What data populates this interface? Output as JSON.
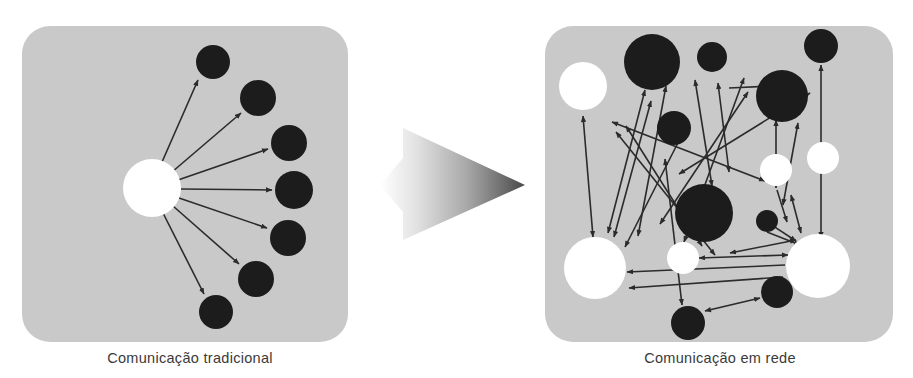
{
  "figure": {
    "type": "concept-diagram",
    "background_color": "#ffffff",
    "panel_fill": "#c9c9c9",
    "panel_corner_radius": 28,
    "node_dark_color": "#1c1c1c",
    "node_light_color": "#ffffff",
    "arrow_color": "#2b2b2b",
    "caption_color": "#3a3a3a",
    "transition_arrow": {
      "name": "gradient-transition-arrow",
      "shape": "triangle-right",
      "x1": 403,
      "y1": 128,
      "x2": 525,
      "y2": 185,
      "x3": 403,
      "y3": 240,
      "notch_x": 403,
      "notch_y": 158,
      "notch_x2": 380,
      "notch_y2": 185,
      "notch_y3": 212,
      "gradient_from": "#ffffff",
      "gradient_to": "#4a4a4a"
    },
    "panels": [
      {
        "id": "traditional",
        "name": "traditional-communication-panel",
        "caption": "Comunicação tradicional",
        "x": 22,
        "y": 26,
        "width": 326,
        "height": 316,
        "nodes": [
          {
            "id": "hub",
            "cx": 152,
            "cy": 188,
            "r": 29,
            "fill": "light",
            "label": "hub-node"
          },
          {
            "id": "r1",
            "cx": 213,
            "cy": 62,
            "r": 17,
            "fill": "dark",
            "label": "receiver-node-1"
          },
          {
            "id": "r2",
            "cx": 258,
            "cy": 98,
            "r": 18,
            "fill": "dark",
            "label": "receiver-node-2"
          },
          {
            "id": "r3",
            "cx": 289,
            "cy": 143,
            "r": 18,
            "fill": "dark",
            "label": "receiver-node-3"
          },
          {
            "id": "r4",
            "cx": 294,
            "cy": 190,
            "r": 19,
            "fill": "dark",
            "label": "receiver-node-4"
          },
          {
            "id": "r5",
            "cx": 288,
            "cy": 238,
            "r": 18,
            "fill": "dark",
            "label": "receiver-node-5"
          },
          {
            "id": "r6",
            "cx": 256,
            "cy": 279,
            "r": 18,
            "fill": "dark",
            "label": "receiver-node-6"
          },
          {
            "id": "r7",
            "cx": 216,
            "cy": 312,
            "r": 17,
            "fill": "dark",
            "label": "receiver-node-7"
          }
        ],
        "edges": [
          {
            "x1": 162,
            "y1": 162,
            "x2": 198,
            "y2": 80,
            "heads": "end"
          },
          {
            "x1": 172,
            "y1": 172,
            "x2": 241,
            "y2": 113,
            "heads": "end"
          },
          {
            "x1": 178,
            "y1": 180,
            "x2": 268,
            "y2": 149,
            "heads": "end"
          },
          {
            "x1": 181,
            "y1": 189,
            "x2": 272,
            "y2": 190,
            "heads": "end"
          },
          {
            "x1": 179,
            "y1": 198,
            "x2": 267,
            "y2": 228,
            "heads": "end"
          },
          {
            "x1": 173,
            "y1": 206,
            "x2": 239,
            "y2": 264,
            "heads": "end"
          },
          {
            "x1": 163,
            "y1": 213,
            "x2": 204,
            "y2": 294,
            "heads": "end"
          }
        ]
      },
      {
        "id": "network",
        "name": "network-communication-panel",
        "caption": "Comunicação em rede",
        "x": 545,
        "y": 26,
        "width": 348,
        "height": 316,
        "nodes": [
          {
            "id": "n1",
            "cx": 583,
            "cy": 86,
            "r": 24,
            "fill": "light",
            "label": "network-node-1"
          },
          {
            "id": "n2",
            "cx": 652,
            "cy": 62,
            "r": 28,
            "fill": "dark",
            "label": "network-node-2"
          },
          {
            "id": "n3",
            "cx": 712,
            "cy": 57,
            "r": 15,
            "fill": "dark",
            "label": "network-node-3"
          },
          {
            "id": "n4",
            "cx": 821,
            "cy": 46,
            "r": 17,
            "fill": "dark",
            "label": "network-node-4"
          },
          {
            "id": "n5",
            "cx": 782,
            "cy": 96,
            "r": 26,
            "fill": "dark",
            "label": "network-node-5"
          },
          {
            "id": "n6",
            "cx": 674,
            "cy": 128,
            "r": 17,
            "fill": "dark",
            "label": "network-node-6"
          },
          {
            "id": "n7",
            "cx": 823,
            "cy": 158,
            "r": 16,
            "fill": "light",
            "label": "network-node-7"
          },
          {
            "id": "n8",
            "cx": 776,
            "cy": 170,
            "r": 16,
            "fill": "light",
            "label": "network-node-8"
          },
          {
            "id": "n9",
            "cx": 704,
            "cy": 213,
            "r": 29,
            "fill": "dark",
            "label": "network-node-9"
          },
          {
            "id": "n10",
            "cx": 767,
            "cy": 221,
            "r": 11,
            "fill": "dark",
            "label": "network-node-10"
          },
          {
            "id": "n11",
            "cx": 595,
            "cy": 268,
            "r": 31,
            "fill": "light",
            "label": "network-node-11"
          },
          {
            "id": "n12",
            "cx": 683,
            "cy": 258,
            "r": 16,
            "fill": "light",
            "label": "network-node-12"
          },
          {
            "id": "n13",
            "cx": 818,
            "cy": 266,
            "r": 32,
            "fill": "light",
            "label": "network-node-13"
          },
          {
            "id": "n14",
            "cx": 777,
            "cy": 292,
            "r": 16,
            "fill": "dark",
            "label": "network-node-14"
          },
          {
            "id": "n15",
            "cx": 688,
            "cy": 323,
            "r": 17,
            "fill": "dark",
            "label": "network-node-15"
          }
        ],
        "edges": [
          {
            "x1": 583,
            "y1": 116,
            "x2": 593,
            "y2": 237,
            "heads": "both"
          },
          {
            "x1": 608,
            "y1": 233,
            "x2": 645,
            "y2": 90,
            "heads": "both"
          },
          {
            "x1": 614,
            "y1": 237,
            "x2": 651,
            "y2": 101,
            "heads": "both"
          },
          {
            "x1": 625,
            "y1": 247,
            "x2": 688,
            "y2": 123,
            "heads": "both"
          },
          {
            "x1": 626,
            "y1": 126,
            "x2": 702,
            "y2": 246,
            "heads": "both"
          },
          {
            "x1": 616,
            "y1": 132,
            "x2": 715,
            "y2": 255,
            "heads": "both"
          },
          {
            "x1": 612,
            "y1": 122,
            "x2": 765,
            "y2": 181,
            "heads": "both"
          },
          {
            "x1": 679,
            "y1": 174,
            "x2": 810,
            "y2": 93,
            "heads": "both"
          },
          {
            "x1": 684,
            "y1": 242,
            "x2": 744,
            "y2": 78,
            "heads": "both"
          },
          {
            "x1": 695,
            "y1": 80,
            "x2": 712,
            "y2": 186,
            "heads": "both"
          },
          {
            "x1": 718,
            "y1": 83,
            "x2": 729,
            "y2": 172,
            "heads": "both"
          },
          {
            "x1": 660,
            "y1": 224,
            "x2": 748,
            "y2": 92,
            "heads": "both"
          },
          {
            "x1": 729,
            "y1": 88,
            "x2": 793,
            "y2": 85,
            "heads": "end"
          },
          {
            "x1": 821,
            "y1": 65,
            "x2": 821,
            "y2": 238,
            "heads": "both"
          },
          {
            "x1": 776,
            "y1": 188,
            "x2": 776,
            "y2": 120,
            "heads": "both"
          },
          {
            "x1": 783,
            "y1": 205,
            "x2": 798,
            "y2": 123,
            "heads": "both"
          },
          {
            "x1": 777,
            "y1": 190,
            "x2": 787,
            "y2": 222,
            "heads": "end"
          },
          {
            "x1": 791,
            "y1": 195,
            "x2": 801,
            "y2": 233,
            "heads": "both"
          },
          {
            "x1": 758,
            "y1": 216,
            "x2": 796,
            "y2": 241,
            "heads": "both"
          },
          {
            "x1": 767,
            "y1": 232,
            "x2": 800,
            "y2": 245,
            "heads": "end"
          },
          {
            "x1": 796,
            "y1": 240,
            "x2": 730,
            "y2": 253,
            "heads": "both"
          },
          {
            "x1": 788,
            "y1": 255,
            "x2": 699,
            "y2": 258,
            "heads": "both"
          },
          {
            "x1": 785,
            "y1": 265,
            "x2": 627,
            "y2": 272,
            "heads": "end"
          },
          {
            "x1": 783,
            "y1": 277,
            "x2": 629,
            "y2": 288,
            "heads": "end"
          },
          {
            "x1": 705,
            "y1": 311,
            "x2": 760,
            "y2": 298,
            "heads": "both"
          },
          {
            "x1": 665,
            "y1": 159,
            "x2": 682,
            "y2": 305,
            "heads": "both"
          },
          {
            "x1": 638,
            "y1": 236,
            "x2": 666,
            "y2": 86,
            "heads": "both"
          }
        ]
      }
    ]
  }
}
